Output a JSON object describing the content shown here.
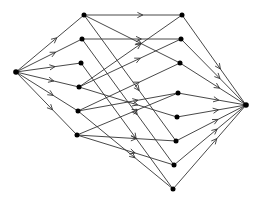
{
  "diagram": {
    "type": "directed-graph",
    "colors": {
      "edge": "#333333",
      "node": "#000000",
      "background": "#ffffff"
    },
    "nodes": [
      {
        "id": "S",
        "x": 16,
        "y": 72
      },
      {
        "id": "L1",
        "x": 84,
        "y": 15
      },
      {
        "id": "L2",
        "x": 82,
        "y": 39
      },
      {
        "id": "L3",
        "x": 81,
        "y": 63
      },
      {
        "id": "L4",
        "x": 79,
        "y": 87
      },
      {
        "id": "L5",
        "x": 78,
        "y": 111
      },
      {
        "id": "L6",
        "x": 77,
        "y": 135
      },
      {
        "id": "R1",
        "x": 182,
        "y": 15
      },
      {
        "id": "R2",
        "x": 181,
        "y": 39
      },
      {
        "id": "R3",
        "x": 180,
        "y": 63
      },
      {
        "id": "R4",
        "x": 178,
        "y": 93
      },
      {
        "id": "R5",
        "x": 177,
        "y": 117
      },
      {
        "id": "R6",
        "x": 176,
        "y": 141
      },
      {
        "id": "R7",
        "x": 174,
        "y": 165
      },
      {
        "id": "R8",
        "x": 173,
        "y": 189
      },
      {
        "id": "T",
        "x": 246,
        "y": 105
      }
    ],
    "edges": [
      [
        "S",
        "L1"
      ],
      [
        "S",
        "L2"
      ],
      [
        "S",
        "L3"
      ],
      [
        "S",
        "L4"
      ],
      [
        "S",
        "L5"
      ],
      [
        "S",
        "L6"
      ],
      [
        "L1",
        "R1"
      ],
      [
        "L1",
        "R3"
      ],
      [
        "L1",
        "R6"
      ],
      [
        "L2",
        "R2"
      ],
      [
        "L2",
        "R7"
      ],
      [
        "L3",
        "R8"
      ],
      [
        "L4",
        "R1"
      ],
      [
        "L4",
        "R2"
      ],
      [
        "L4",
        "R5"
      ],
      [
        "L5",
        "R3"
      ],
      [
        "L5",
        "R4"
      ],
      [
        "L5",
        "R8"
      ],
      [
        "L6",
        "R4"
      ],
      [
        "L6",
        "R6"
      ],
      [
        "L6",
        "R7"
      ],
      [
        "R1",
        "T"
      ],
      [
        "R2",
        "T"
      ],
      [
        "R3",
        "T"
      ],
      [
        "R4",
        "T"
      ],
      [
        "R5",
        "T"
      ],
      [
        "R6",
        "T"
      ],
      [
        "R7",
        "T"
      ],
      [
        "R8",
        "T"
      ]
    ]
  }
}
